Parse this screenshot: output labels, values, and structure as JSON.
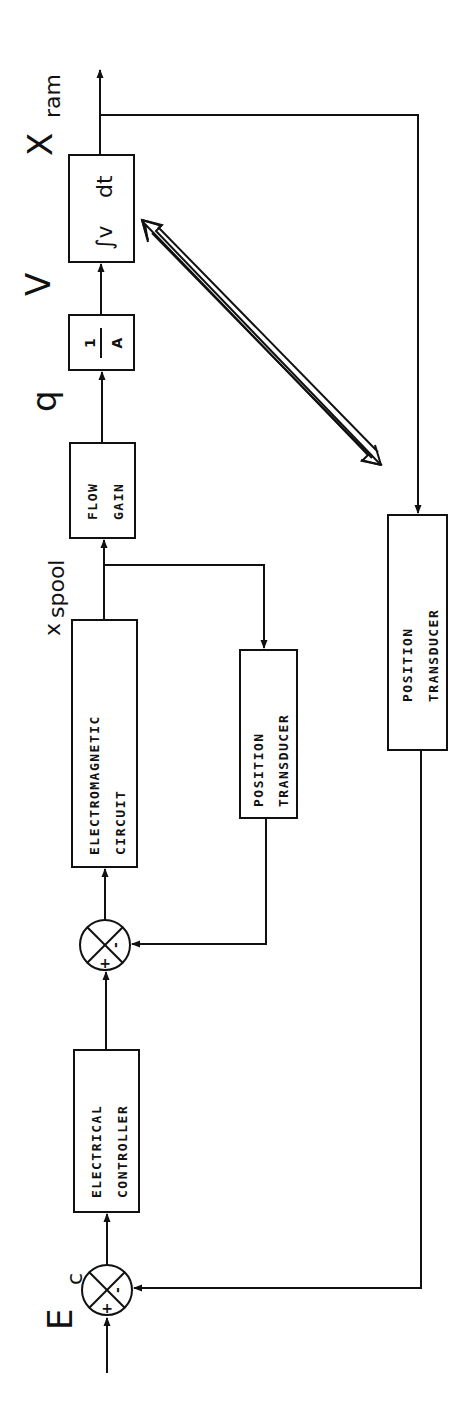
{
  "diagram": {
    "orientation": "rotated-90-ccw",
    "input_signal": {
      "main": "E",
      "sub": "c"
    },
    "output_signal": {
      "main": "X",
      "sub": "ram"
    },
    "signals": {
      "spool": {
        "main": "x",
        "sub": "spool"
      },
      "flow": "q",
      "velocity": "V"
    },
    "summing_junctions": [
      {
        "id": "sum1",
        "plus": "+",
        "minus": "-"
      },
      {
        "id": "sum2",
        "plus": "+",
        "minus": "-"
      }
    ],
    "blocks": {
      "electrical_controller": {
        "line1": "ELECTRICAL",
        "line2": "CONTROLLER"
      },
      "electromagnetic_circuit": {
        "line1": "ELECTROMAGNETIC",
        "line2": "CIRCUIT"
      },
      "inner_position_transducer": {
        "line1": "POSITION",
        "line2": "TRANSDUCER"
      },
      "flow_gain": {
        "line1": "FLOW",
        "line2": "GAIN"
      },
      "area": {
        "numerator": "1",
        "denominator": "A"
      },
      "integrator": {
        "integral": "∫v",
        "dt": "dt"
      },
      "outer_position_transducer": {
        "line1": "POSITION",
        "line2": "TRANSDUCER"
      }
    }
  }
}
